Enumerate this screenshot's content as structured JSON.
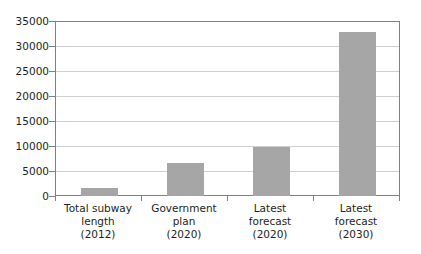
{
  "chart_data": {
    "type": "bar",
    "title": "",
    "subtitle": "",
    "xlabel": "",
    "ylabel": "",
    "ylim": [
      0,
      35000
    ],
    "grid": true,
    "legend": "none",
    "bar_color": "#a6a6a6",
    "axis_color": "#808080",
    "gridline_color": "#cfcfcf",
    "categories": [
      "Total subway length (2012)",
      "Government plan (2020)",
      "Latest forecast (2020)",
      "Latest forecast (2030)"
    ],
    "category_lines": [
      [
        "Total subway",
        "length",
        "(2012)"
      ],
      [
        "Government",
        "plan",
        "(2020)"
      ],
      [
        "Latest",
        "forecast",
        "(2020)"
      ],
      [
        "Latest",
        "forecast",
        "(2030)"
      ]
    ],
    "values": [
      1700,
      6700,
      9800,
      32800
    ],
    "yticks": [
      0,
      5000,
      10000,
      15000,
      20000,
      25000,
      30000,
      35000
    ],
    "ytick_labels": [
      "0",
      "5000",
      "10000",
      "15000",
      "20000",
      "25000",
      "30000",
      "35000"
    ]
  }
}
